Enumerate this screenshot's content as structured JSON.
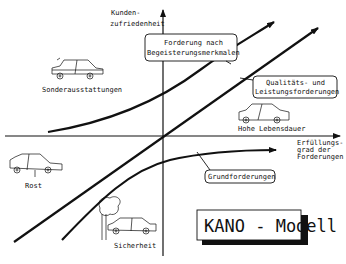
{
  "diagram": {
    "title": "KANO - Modell",
    "axes": {
      "y_label_line1": "Kunden-",
      "y_label_line2": "zufriedenheit",
      "x_label_line1": "Erfüllungs-",
      "x_label_line2": "grad der",
      "x_label_line3": "Forderungen"
    },
    "curves": {
      "excitement_line1": "Forderung nach",
      "excitement_line2": "Begeisterungsmerkmalen",
      "performance_line1": "Qualitäts- und",
      "performance_line2": "Leistungsforderungen",
      "basic": "Grundforderungen"
    },
    "examples": {
      "top_left": "Sonderausstattungen",
      "top_right": "Hohe Lebensdauer",
      "bottom_left": "Rost",
      "bottom_middle": "Sicherheit"
    },
    "colors": {
      "ink": "#111111",
      "background": "#ffffff"
    }
  }
}
